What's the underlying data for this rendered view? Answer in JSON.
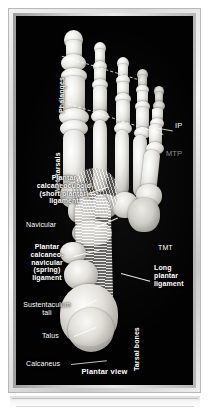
{
  "figure": {
    "caption": "Plantar view",
    "view_colors": {
      "background": "#020202",
      "frame": "#d9d9d9",
      "label_text": "#ffffff",
      "dim_label_text": "#8d8d8d",
      "bone_highlight": "#ffffff",
      "bone_shadow": "#5d5b57"
    }
  },
  "labels": {
    "phalanges": "Phalanges",
    "metatarsals": "Metatarsals",
    "tarsal_bones": "Tarsal bones",
    "ip": "IP",
    "mtp": "MTP",
    "tmt": "TMT",
    "plantar_calcaneocuboid": "Plantar\ncalcaneocuboid\n(short plantar)\nligament",
    "navicular": "Navicular",
    "plantar_calcaneonavicular": "Plantar\ncalcaneo-\nnavicular\n(spring)\nligament",
    "sustentaculum_tali": "Sustentaculum\ntali",
    "talus": "Talus",
    "calcaneus": "Calcaneus",
    "long_plantar_ligament": "Long\nplantar\nligament"
  }
}
